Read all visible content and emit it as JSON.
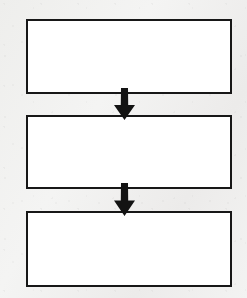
{
  "diagram": {
    "type": "flowchart",
    "orientation": "vertical-top-to-bottom",
    "title": "",
    "background_color": "#f1f1f0",
    "box_fill_color": "#ffffff",
    "box_border_color": "#171717",
    "arrow_color": "#131313",
    "node_count": 3,
    "connector_count": 2,
    "nodes": [
      {
        "id": "node-1",
        "label": "",
        "shape": "rectangle",
        "x": 26,
        "y": 19,
        "width": 206,
        "height": 75
      },
      {
        "id": "node-2",
        "label": "",
        "shape": "rectangle",
        "x": 26,
        "y": 115,
        "width": 206,
        "height": 74
      },
      {
        "id": "node-3",
        "label": "",
        "shape": "rectangle",
        "x": 26,
        "y": 211,
        "width": 206,
        "height": 76
      }
    ],
    "connectors": [
      {
        "id": "connector-1",
        "label": "",
        "from": "node-1",
        "to": "node-2",
        "direction": "down",
        "x": 113,
        "y": 88,
        "width": 23,
        "height": 32
      },
      {
        "id": "connector-2",
        "label": "",
        "from": "node-2",
        "to": "node-3",
        "direction": "down",
        "x": 113,
        "y": 183,
        "width": 23,
        "height": 33
      }
    ]
  }
}
